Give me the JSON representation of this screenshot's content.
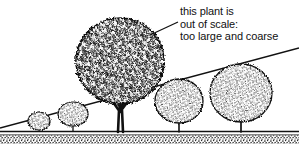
{
  "figure": {
    "background_color": "#ffffff",
    "ink_color": "#111111",
    "width": 299,
    "height": 144
  },
  "annotation": {
    "name": "out-of-scale-callout",
    "lines": [
      "this plant is",
      "out of scale:",
      "too large and coarse"
    ],
    "line1": "this plant is",
    "line2": "out of scale:",
    "line3": "too large and coarse",
    "leader_line": {
      "from_x": 178,
      "from_y": 22,
      "to_x": 150,
      "to_y": 35
    }
  },
  "ground": {
    "ground_line_y": 132,
    "soil_band_top": 134,
    "soil_band_bottom": 144,
    "soil_texture": "stipple"
  },
  "slope_line": {
    "name": "grade-slope-line",
    "start_x": 0,
    "start_y": 128,
    "end_x": 299,
    "end_y": 48
  },
  "plants": [
    {
      "id": "shrub-1",
      "label": "small shrub",
      "center_x": 39,
      "base_y": 132,
      "canopy_cx": 39,
      "canopy_cy": 122,
      "canopy_rx": 11,
      "canopy_ry": 9,
      "trunk_height": 9,
      "texture": "fine",
      "in_scale": true
    },
    {
      "id": "shrub-2",
      "label": "small shrub",
      "center_x": 73,
      "base_y": 132,
      "canopy_cx": 73,
      "canopy_cy": 115,
      "canopy_rx": 15,
      "canopy_ry": 12,
      "trunk_height": 15,
      "texture": "fine",
      "in_scale": true
    },
    {
      "id": "oversized-tree",
      "label": "oversized coarse tree",
      "center_x": 120,
      "base_y": 132,
      "canopy_cx": 120,
      "canopy_cy": 60,
      "canopy_rx": 44,
      "canopy_ry": 43,
      "trunk_height": 48,
      "texture": "coarse",
      "in_scale": false
    },
    {
      "id": "tree-right-1",
      "label": "medium tree",
      "center_x": 179,
      "base_y": 132,
      "canopy_cx": 179,
      "canopy_cy": 101,
      "canopy_rx": 24,
      "canopy_ry": 22,
      "trunk_height": 23,
      "texture": "fine",
      "in_scale": true
    },
    {
      "id": "tree-right-2",
      "label": "medium tree",
      "center_x": 241,
      "base_y": 132,
      "canopy_cx": 241,
      "canopy_cy": 93,
      "canopy_rx": 31,
      "canopy_ry": 29,
      "trunk_height": 26,
      "texture": "fine",
      "in_scale": true
    }
  ]
}
